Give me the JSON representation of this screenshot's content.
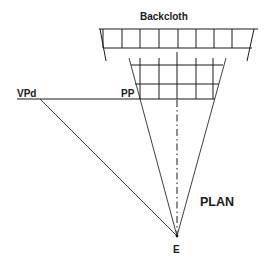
{
  "diagram": {
    "title_label": "Backcloth",
    "plan_label": "PLAN",
    "vanishing_point_label": "VPd",
    "picture_plane_label": "PP",
    "eye_label": "E",
    "colors": {
      "line": "#1a1a1a",
      "background": "#ffffff"
    },
    "backcloth": {
      "top_y": 29,
      "bottom_y": 48,
      "left_x": 103,
      "right_x": 254,
      "dividers_x": [
        122,
        140,
        159,
        178,
        196,
        214,
        232
      ],
      "cells": 8
    },
    "front_grid": {
      "rows_y": [
        65,
        84,
        99
      ],
      "columns_x": [
        140,
        159,
        177,
        196,
        213
      ],
      "rows": 2,
      "columns": 4
    },
    "eye_point": {
      "x": 177,
      "y": 236
    },
    "vpd_point": {
      "x": 40,
      "y": 99
    }
  }
}
